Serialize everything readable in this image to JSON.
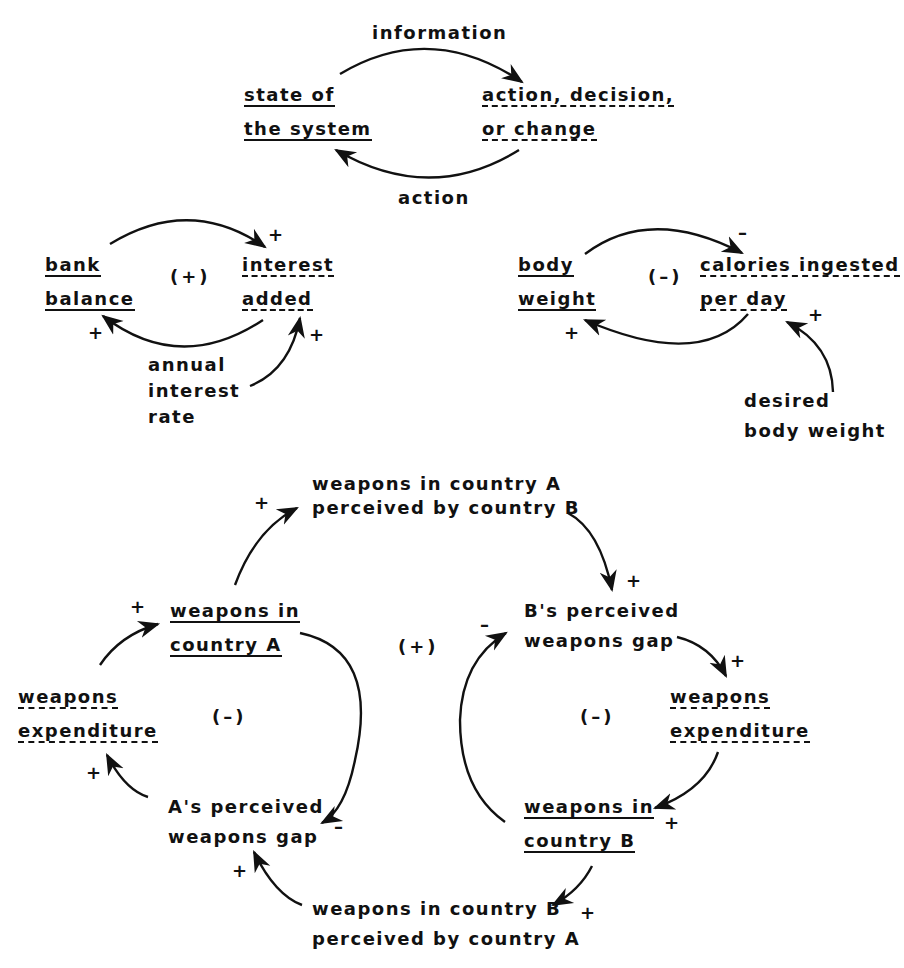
{
  "diagram": {
    "top_loop": {
      "edge_top_label": "information",
      "edge_bottom_label": "action",
      "left_node": [
        "state of",
        "the system"
      ],
      "right_node": [
        "action, decision,",
        "or change"
      ]
    },
    "bank_loop": {
      "left_node": [
        "bank",
        "balance"
      ],
      "right_node": [
        "interest",
        "added"
      ],
      "loop_polarity": "(+)",
      "external_node": [
        "annual",
        "interest",
        "rate"
      ],
      "signs": {
        "to_interest": "+",
        "to_balance": "+",
        "from_rate": "+"
      }
    },
    "weight_loop": {
      "left_node": [
        "body",
        "weight"
      ],
      "right_node": [
        "calories ingested",
        "per day"
      ],
      "loop_polarity": "(–)",
      "external_node": [
        "desired",
        "body weight"
      ],
      "signs": {
        "to_calories": "–",
        "to_weight": "+",
        "from_desired": "+"
      }
    },
    "arms_race": {
      "node_a_perceived_by_b": [
        "weapons in country A",
        "perceived by country B"
      ],
      "node_b_gap": [
        "B's perceived",
        "weapons gap"
      ],
      "node_b_expenditure": [
        "weapons",
        "expenditure"
      ],
      "node_weapons_b": [
        "weapons in",
        "country B"
      ],
      "node_b_perceived_by_a": [
        "weapons in country B",
        "perceived by country A"
      ],
      "node_a_gap": [
        "A's perceived",
        "weapons gap"
      ],
      "node_a_expenditure": [
        "weapons",
        "expenditure"
      ],
      "node_weapons_a": [
        "weapons in",
        "country A"
      ],
      "loop_polarity_center": "(+)",
      "loop_polarity_left": "(–)",
      "loop_polarity_right": "(–)",
      "signs": {
        "a_to_perceived": "+",
        "perceived_to_bgap": "+",
        "bgap_to_bexp": "+",
        "bexp_to_wb": "+",
        "wb_to_perceived": "+",
        "perceived_to_agap": "+",
        "agap_to_aexp": "+",
        "aexp_to_wa": "+",
        "wa_to_agap": "–",
        "wb_to_bgap": "–"
      }
    }
  }
}
